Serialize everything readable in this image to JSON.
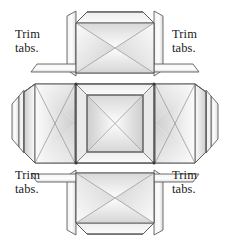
{
  "figure": {
    "type": "cruciform-box-net",
    "panel_count": 5,
    "background_color": "#ffffff"
  },
  "labels": {
    "top_left": {
      "line1": "Trim",
      "line2": "tabs."
    },
    "top_right": {
      "line1": "Trim",
      "line2": "tabs."
    },
    "bottom_left": {
      "line1": "Trim",
      "line2": "tabs."
    },
    "bottom_right": {
      "line1": "Trim",
      "line2": "tabs."
    }
  },
  "style": {
    "stroke_color": "#5a5a5a",
    "stroke_dark": "#3c3c3c",
    "fill_light": "#fdfdfd",
    "fill_mid": "#e2e2e2",
    "fill_dark": "#c9c9c9",
    "text_color": "#1a1a1a"
  },
  "panels": [
    {
      "name": "top-panel",
      "position": "top"
    },
    {
      "name": "left-panel",
      "position": "left"
    },
    {
      "name": "center-panel",
      "position": "center"
    },
    {
      "name": "right-panel",
      "position": "right"
    },
    {
      "name": "bottom-panel",
      "position": "bottom"
    }
  ],
  "tabs": [
    {
      "name": "tab-top-left-vertical",
      "shape": "parallelogram"
    },
    {
      "name": "tab-top-right-vertical",
      "shape": "parallelogram"
    },
    {
      "name": "tab-bottom-left-vertical",
      "shape": "parallelogram"
    },
    {
      "name": "tab-bottom-right-vertical",
      "shape": "parallelogram"
    },
    {
      "name": "tab-left-upper-horizontal",
      "shape": "trapezoid"
    },
    {
      "name": "tab-right-upper-horizontal",
      "shape": "trapezoid"
    },
    {
      "name": "tab-left-lower-horizontal",
      "shape": "trapezoid"
    },
    {
      "name": "tab-right-lower-horizontal",
      "shape": "trapezoid"
    },
    {
      "name": "tab-far-left-flap",
      "shape": "hexagon-flap"
    },
    {
      "name": "tab-far-right-flap",
      "shape": "hexagon-flap"
    }
  ]
}
